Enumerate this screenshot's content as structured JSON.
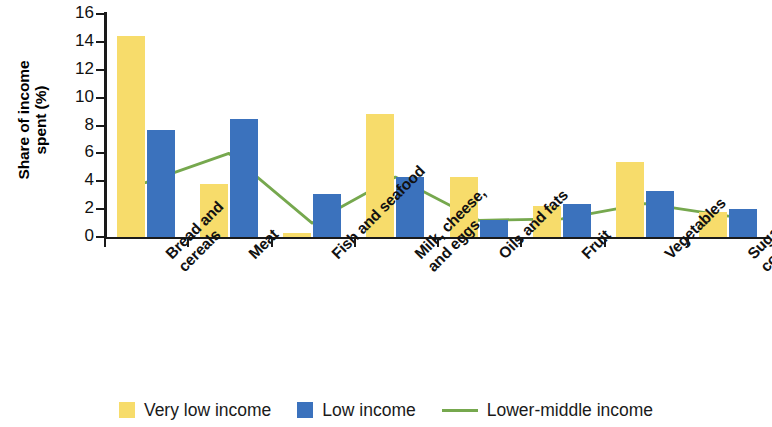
{
  "chart_data": {
    "type": "bar",
    "title": "",
    "subtitle": "",
    "xlabel": "",
    "ylabel_line1": "Share of income",
    "ylabel_line2": "spent (%)",
    "ylabel": "Share of income spent (%)",
    "ylim": [
      0,
      16
    ],
    "ytick_step": 2,
    "yticks": [
      "16",
      "14",
      "12",
      "10",
      "8",
      "6",
      "4",
      "2",
      "0"
    ],
    "grid": false,
    "legend_position": "bottom",
    "categories": [
      "Bread and cereals",
      "Meat",
      "Fish and seafood",
      "Milk, cheese, and eggs",
      "Oils and fats",
      "Fruit",
      "Vegetables",
      "Sugar and confectionery"
    ],
    "category_lines": [
      [
        "Bread and",
        "cereals"
      ],
      [
        "Meat"
      ],
      [
        "Fish and seafood"
      ],
      [
        "Milk, cheese,",
        "and eggs"
      ],
      [
        "Oils and fats"
      ],
      [
        "Fruit"
      ],
      [
        "Vegetables"
      ],
      [
        "Sugar and",
        "confectionery"
      ]
    ],
    "series": [
      {
        "name": "Very low income",
        "type": "bar",
        "color": "#f7dc6b",
        "values": [
          14.4,
          3.8,
          0.3,
          8.8,
          4.3,
          2.2,
          5.4,
          1.8
        ]
      },
      {
        "name": "Low income",
        "type": "bar",
        "color": "#3b72bd",
        "values": [
          7.7,
          8.5,
          3.1,
          4.3,
          1.2,
          2.4,
          3.3,
          2.0
        ]
      },
      {
        "name": "Lower-middle income",
        "type": "line",
        "color": "#76a84e",
        "values": [
          3.9,
          6.0,
          1.0,
          4.3,
          1.2,
          1.3,
          2.4,
          1.5
        ]
      }
    ]
  },
  "legend": {
    "items": [
      {
        "label": "Very low income",
        "marker": "yellow-square-swatch"
      },
      {
        "label": "Low income",
        "marker": "blue-square-swatch"
      },
      {
        "label": "Lower-middle income",
        "marker": "green-line-swatch"
      }
    ]
  }
}
